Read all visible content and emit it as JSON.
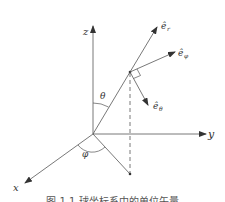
{
  "diagram": {
    "colors": {
      "line": "#555555",
      "text": "#333333",
      "background": "#ffffff"
    },
    "axes": {
      "z": {
        "label": "z"
      },
      "y": {
        "label": "y"
      },
      "x": {
        "label": "x"
      }
    },
    "angles": {
      "theta": {
        "label": "θ"
      },
      "phi": {
        "label": "φ"
      }
    },
    "unit_vectors": {
      "r": {
        "label": "ê",
        "subscript": "r"
      },
      "phi": {
        "label": "ê",
        "subscript": "φ"
      },
      "theta": {
        "label": "ê",
        "subscript": "θ"
      }
    },
    "caption": "图 1.1  球坐标系中的单位矢量"
  }
}
